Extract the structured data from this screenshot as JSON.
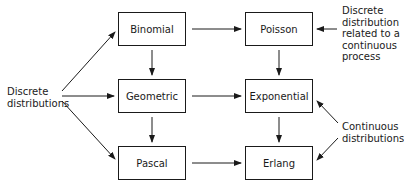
{
  "diagram": {
    "nodes": [
      {
        "id": "binomial",
        "label": "Binomial",
        "x": 118,
        "y": 12,
        "w": 68,
        "h": 34
      },
      {
        "id": "poisson",
        "label": "Poisson",
        "x": 245,
        "y": 12,
        "w": 68,
        "h": 34
      },
      {
        "id": "geometric",
        "label": "Geometric",
        "x": 118,
        "y": 79,
        "w": 68,
        "h": 34
      },
      {
        "id": "exponential",
        "label": "Exponential",
        "x": 245,
        "y": 79,
        "w": 68,
        "h": 34
      },
      {
        "id": "pascal",
        "label": "Pascal",
        "x": 118,
        "y": 146,
        "w": 68,
        "h": 34
      },
      {
        "id": "erlang",
        "label": "Erlang",
        "x": 245,
        "y": 146,
        "w": 68,
        "h": 34
      }
    ],
    "annotations": {
      "discrete": "Discrete\ndistributions",
      "poisson_note": "Discrete\ndistribution\nrelated to a\ncontinuous\nprocess",
      "continuous": "Continuous\ndistributions"
    },
    "edges": [
      {
        "from": "discrete-label",
        "to": "binomial"
      },
      {
        "from": "discrete-label",
        "to": "geometric"
      },
      {
        "from": "discrete-label",
        "to": "pascal"
      },
      {
        "from": "binomial",
        "to": "poisson"
      },
      {
        "from": "geometric",
        "to": "exponential"
      },
      {
        "from": "pascal",
        "to": "erlang"
      },
      {
        "from": "binomial",
        "to": "geometric"
      },
      {
        "from": "geometric",
        "to": "pascal"
      },
      {
        "from": "poisson",
        "to": "exponential"
      },
      {
        "from": "exponential",
        "to": "erlang"
      },
      {
        "from": "poisson-note",
        "to": "poisson"
      },
      {
        "from": "continuous-label",
        "to": "exponential"
      },
      {
        "from": "continuous-label",
        "to": "erlang"
      }
    ],
    "colors": {
      "stroke": "#1a1a1a",
      "background": "#ffffff"
    }
  }
}
